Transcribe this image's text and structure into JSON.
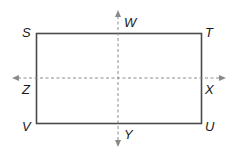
{
  "diagram": {
    "type": "rectangle-with-symmetry-lines",
    "rectangle": {
      "vertices": [
        "S",
        "T",
        "U",
        "V"
      ]
    },
    "lines": [
      {
        "name": "vertical-symmetry-line",
        "endpoints": [
          "W",
          "Y"
        ],
        "style": "dashed",
        "arrows": "both"
      },
      {
        "name": "horizontal-symmetry-line",
        "endpoints": [
          "Z",
          "X"
        ],
        "style": "dashed",
        "arrows": "both"
      }
    ],
    "labels": {
      "S": "S",
      "T": "T",
      "U": "U",
      "V": "V",
      "W": "W",
      "X": "X",
      "Y": "Y",
      "Z": "Z"
    },
    "colors": {
      "rect": "#4a4a4a",
      "dashed": "#8a8a8a",
      "text": "#1a1a1a"
    }
  }
}
